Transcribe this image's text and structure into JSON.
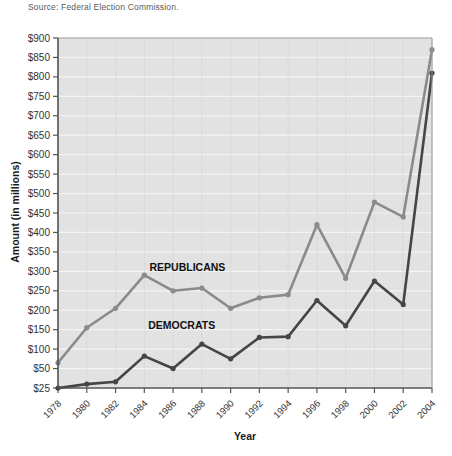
{
  "source_note": "Source: Federal Election Commission.",
  "chart_data": {
    "type": "line",
    "title": "",
    "xlabel": "Year",
    "ylabel": "Amount (in millions)",
    "categories": [
      "1978",
      "1980",
      "1982",
      "1984",
      "1986",
      "1988",
      "1990",
      "1992",
      "1994",
      "1996",
      "1998",
      "2000",
      "2002",
      "2004"
    ],
    "ytick_labels": [
      "$25",
      "$50",
      "$100",
      "$150",
      "$200",
      "$250",
      "$300",
      "$350",
      "$400",
      "$450",
      "$500",
      "$550",
      "$600",
      "$650",
      "$700",
      "$750",
      "$800",
      "$850",
      "$900"
    ],
    "ytick_values": [
      25,
      50,
      100,
      150,
      200,
      250,
      300,
      350,
      400,
      450,
      500,
      550,
      600,
      650,
      700,
      750,
      800,
      850,
      900
    ],
    "ylim": [
      25,
      900
    ],
    "grid": true,
    "legend_position": "inline-annotation",
    "series": [
      {
        "name": "REPUBLICANS",
        "color": "#8a8a8a",
        "label_x": 1987.0,
        "label_y": 300,
        "values": [
          65,
          155,
          205,
          290,
          250,
          257,
          205,
          232,
          240,
          420,
          282,
          478,
          440,
          870
        ]
      },
      {
        "name": "DEMOCRATS",
        "color": "#454545",
        "label_x": 1986.6,
        "label_y": 152,
        "values": [
          25,
          30,
          33,
          82,
          50,
          113,
          75,
          130,
          132,
          225,
          160,
          275,
          215,
          810
        ]
      }
    ],
    "plot_background": "#e2e2e2",
    "gridline_color": "#f4f4f4",
    "axis_color": "#555555"
  }
}
